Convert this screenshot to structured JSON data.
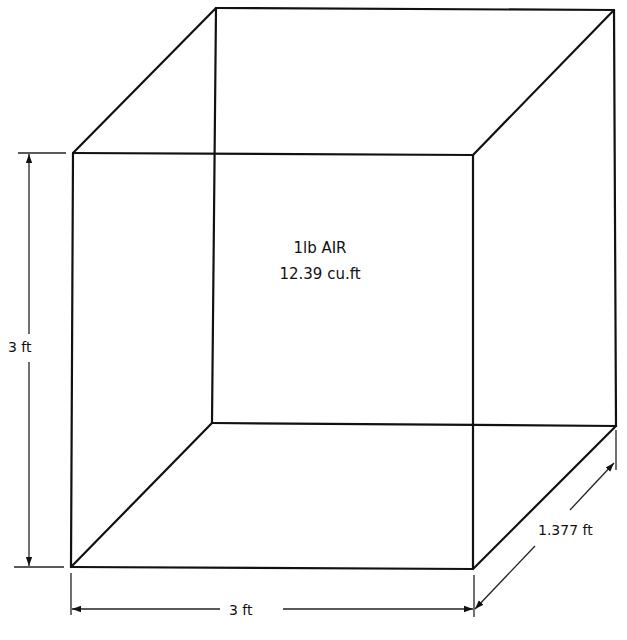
{
  "diagram": {
    "type": "isometric-box",
    "center_label": {
      "line1": "1lb AIR",
      "line2": "12.39 cu.ft"
    },
    "dimensions": {
      "height": "3 ft",
      "width": "3 ft",
      "depth": "1.377 ft"
    },
    "colors": {
      "line": "#111111",
      "background": "#ffffff"
    }
  }
}
